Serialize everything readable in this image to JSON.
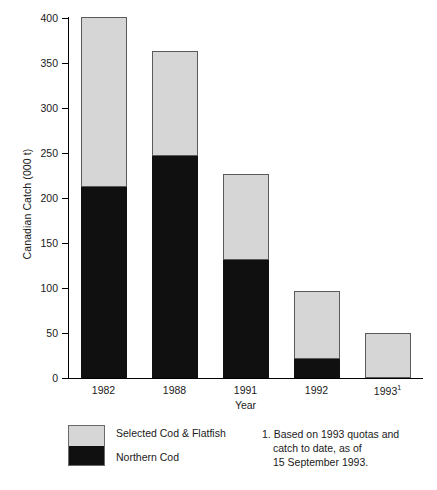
{
  "chart_data": {
    "type": "bar",
    "subtype": "stacked",
    "title": "",
    "xlabel": "Year",
    "ylabel": "Canadian Catch (000 t)",
    "categories": [
      "1982",
      "1988",
      "1991",
      "1992",
      "1993"
    ],
    "category_labels": [
      "1982",
      "1988",
      "1991",
      "1992",
      "1993¹"
    ],
    "category_footnote_markers": [
      "",
      "",
      "",
      "",
      "1"
    ],
    "ylim": [
      0,
      400
    ],
    "yticks": [
      0,
      50,
      100,
      150,
      200,
      250,
      300,
      350,
      400
    ],
    "ytick_labels": [
      "0",
      "50",
      "100",
      "150",
      "200",
      "250",
      "300",
      "350",
      "400"
    ],
    "grid": false,
    "legend_position": "bottom-left",
    "series": [
      {
        "name": "Northern Cod",
        "color": "#101010",
        "values": [
          212,
          247,
          131,
          21,
          0
        ]
      },
      {
        "name": "Selected Cod & Flatfish",
        "color": "#d6d6d6",
        "values": [
          189,
          116,
          96,
          76,
          50
        ]
      }
    ],
    "totals": [
      401,
      363,
      227,
      97,
      50
    ],
    "stack_order_bottom_to_top": [
      "Northern Cod",
      "Selected Cod & Flatfish"
    ]
  },
  "legend": {
    "items": [
      {
        "label": "Selected Cod & Flatfish",
        "color": "#d6d6d6"
      },
      {
        "label": "Northern Cod",
        "color": "#101010"
      }
    ]
  },
  "footnote": {
    "line1": "1. Based on 1993 quotas and",
    "line2": "catch to date, as of",
    "line3": "15 September 1993."
  },
  "axes": {
    "y_title": "Canadian Catch (000 t)",
    "x_title": "Year"
  }
}
